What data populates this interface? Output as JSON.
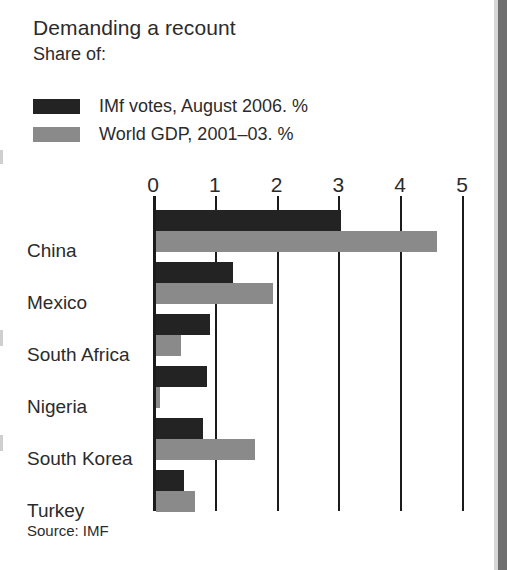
{
  "header": {
    "title": "Demanding a recount",
    "subtitle": "Share of:"
  },
  "legend": {
    "items": [
      {
        "label": "IMf votes, August 2006. %",
        "color": "#232323",
        "key": "imf"
      },
      {
        "label": "World GDP, 2001–03. %",
        "color": "#8a8a8a",
        "key": "gdp"
      }
    ]
  },
  "source": "Source: IMF",
  "colors": {
    "imf_bar": "#232323",
    "gdp_bar": "#8a8a8a",
    "axis": "#1b1b1b",
    "text": "#2b2b2b",
    "edge_strip": "#6f6f6f"
  },
  "chart_data": {
    "type": "bar",
    "orientation": "horizontal",
    "title": "Demanding a recount",
    "subtitle": "Share of:",
    "xlabel": "",
    "ylabel": "",
    "xlim": [
      0,
      5
    ],
    "xticks": [
      0,
      1,
      2,
      3,
      4,
      5
    ],
    "xtick_labels": [
      "0",
      "1",
      "2",
      "3",
      "4",
      "5"
    ],
    "grid": true,
    "legend_position": "top-left",
    "categories": [
      "China",
      "Mexico",
      "South Africa",
      "Nigeria",
      "South Korea",
      "Turkey"
    ],
    "series": [
      {
        "name": "IMf votes, August 2006. %",
        "color": "#232323",
        "values": [
          3.0,
          1.25,
          0.87,
          0.83,
          0.76,
          0.45
        ]
      },
      {
        "name": "World GDP, 2001–03. %",
        "color": "#8a8a8a",
        "values": [
          4.55,
          1.9,
          0.4,
          0.06,
          1.6,
          0.63
        ]
      }
    ],
    "source": "Source: IMF"
  }
}
